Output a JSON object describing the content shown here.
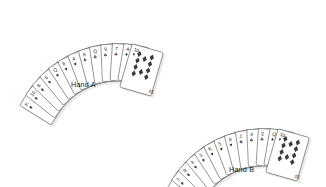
{
  "figure": {
    "type": "illustration",
    "background_color": "#ffffff",
    "card_face_color": "#ffffff",
    "card_outline_color": "#4a4a4a",
    "pip_color": "#3a3a3a",
    "index_color": "#1a1a1a",
    "shadow_color": "#b8b8b8"
  },
  "hands": [
    {
      "id": "hand-a",
      "label": "Hand A",
      "card_count": 13,
      "fan": {
        "center_x": 118,
        "center_y": 152,
        "radius": 108,
        "start_angle": -58,
        "end_angle": 16,
        "card_width": 25,
        "card_height": 37
      },
      "label_position": {
        "x": 71,
        "y": 80
      },
      "cards": [
        {
          "index": "K",
          "suit": "spade"
        },
        {
          "index": "10",
          "suit": "spade"
        },
        {
          "index": "8",
          "suit": "spade"
        },
        {
          "index": "6",
          "suit": "spade"
        },
        {
          "index": "Q",
          "suit": "heart"
        },
        {
          "index": "8",
          "suit": "heart"
        },
        {
          "index": "4",
          "suit": "heart"
        },
        {
          "index": "A",
          "suit": "club"
        },
        {
          "index": "Q",
          "suit": "club"
        },
        {
          "index": "9",
          "suit": "club"
        },
        {
          "index": "7",
          "suit": "club"
        },
        {
          "index": "A",
          "suit": "diamond"
        },
        {
          "index": "10",
          "suit": "diamond"
        }
      ],
      "face_up_card": {
        "index": "10",
        "suit": "diamond",
        "pip_count": 10
      }
    },
    {
      "id": "hand-b",
      "label": "Hand B",
      "card_count": 13,
      "fan": {
        "center_x": 118,
        "center_y": 152,
        "radius": 108,
        "start_angle": -58,
        "end_angle": 16,
        "card_width": 25,
        "card_height": 37
      },
      "label_position": {
        "x": 229,
        "y": 165
      },
      "offset": {
        "x": 146,
        "y": 85
      },
      "cards": [
        {
          "index": "A",
          "suit": "spade"
        },
        {
          "index": "J",
          "suit": "spade"
        },
        {
          "index": "9",
          "suit": "spade"
        },
        {
          "index": "4",
          "suit": "spade"
        },
        {
          "index": "3",
          "suit": "spade"
        },
        {
          "index": "K",
          "suit": "heart"
        },
        {
          "index": "5",
          "suit": "heart"
        },
        {
          "index": "A",
          "suit": "heart"
        },
        {
          "index": "J",
          "suit": "club"
        },
        {
          "index": "4",
          "suit": "club"
        },
        {
          "index": "2",
          "suit": "club"
        },
        {
          "index": "Q",
          "suit": "diamond"
        },
        {
          "index": "10",
          "suit": "diamond"
        }
      ],
      "face_up_card": {
        "index": "10",
        "suit": "diamond",
        "pip_count": 10
      }
    }
  ]
}
